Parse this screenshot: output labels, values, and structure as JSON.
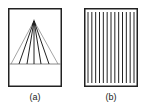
{
  "figure": {
    "panels": [
      {
        "id": "a",
        "label": "(a)",
        "description": "converging lines (perspective fan)",
        "frame": {
          "x": 8,
          "y": 8,
          "w": 54,
          "h": 79
        },
        "apex": {
          "x": 34,
          "y": 21
        },
        "baseline_y": 64,
        "fan_feet_x": [
          11,
          19,
          27,
          34,
          41,
          49,
          58
        ]
      },
      {
        "id": "b",
        "label": "(b)",
        "description": "parallel vertical lines",
        "frame": {
          "x": 84,
          "y": 8,
          "w": 54,
          "h": 79
        },
        "stripe_count": 13
      }
    ],
    "colors": {
      "line": "#222222",
      "background": "#ffffff"
    }
  }
}
